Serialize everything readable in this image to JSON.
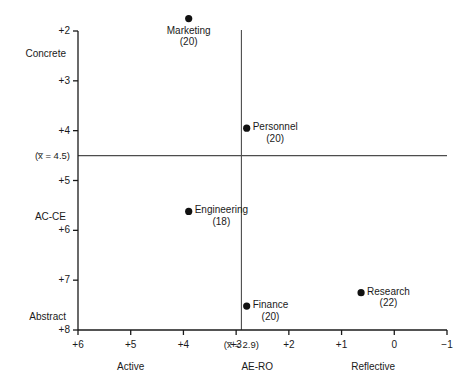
{
  "chart_data": {
    "type": "scatter",
    "title": "",
    "xlabel": "AE-RO",
    "ylabel": "AC-CE",
    "xlim": [
      6,
      -1
    ],
    "ylim": [
      8,
      2
    ],
    "grid": false,
    "legend": "none",
    "x_axis": {
      "label": "AE-RO",
      "left_anchor_label": "Active",
      "right_anchor_label": "Reflective",
      "ticks": [
        "+6",
        "+5",
        "+4",
        "+3",
        "+2",
        "+1",
        "0",
        "−1"
      ],
      "tick_values": [
        6,
        5,
        4,
        3,
        2,
        1,
        0,
        -1
      ],
      "mean_label": "(x̅ = 2.9)",
      "mean_value": 2.9
    },
    "y_axis": {
      "label": "AC-CE",
      "top_anchor_label": "Concrete",
      "bottom_anchor_label": "Abstract",
      "ticks": [
        "+2",
        "+3",
        "+4",
        "+5",
        "+6",
        "+7",
        "+8"
      ],
      "tick_values": [
        2,
        3,
        4,
        5,
        6,
        7,
        8
      ],
      "mean_label": "(x̅ = 4.5)",
      "mean_value": 4.5
    },
    "points": [
      {
        "name": "Marketing",
        "count": "(20)",
        "n": 20,
        "x": 3.9,
        "y": 1.75,
        "label_position": "below"
      },
      {
        "name": "Personnel",
        "count": "(20)",
        "n": 20,
        "x": 2.8,
        "y": 3.95,
        "label_position": "right"
      },
      {
        "name": "Engineering",
        "count": "(18)",
        "n": 18,
        "x": 3.9,
        "y": 5.62,
        "label_position": "right"
      },
      {
        "name": "Finance",
        "count": "(20)",
        "n": 20,
        "x": 2.8,
        "y": 7.52,
        "label_position": "right"
      },
      {
        "name": "Research",
        "count": "(22)",
        "n": 22,
        "x": 0.63,
        "y": 7.25,
        "label_position": "right"
      }
    ],
    "colors": {
      "point": "#111111",
      "axis": "#1a1a1a",
      "mean_line": "#4d4d4d",
      "background": "#ffffff",
      "text": "#1a1a1a"
    }
  }
}
